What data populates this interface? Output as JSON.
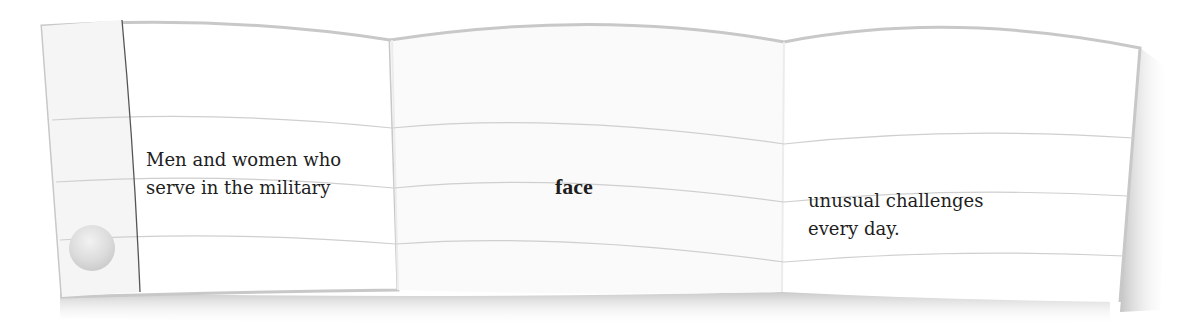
{
  "flipbook": {
    "panels": [
      {
        "id": "left",
        "lines": [
          "Men and women who",
          "serve in the military"
        ],
        "weight": "normal"
      },
      {
        "id": "middle",
        "lines": [
          "face"
        ],
        "weight": "bold"
      },
      {
        "id": "right",
        "lines": [
          "unusual challenges",
          "every day."
        ],
        "weight": "normal"
      }
    ]
  },
  "colors": {
    "paper": "#ffffff",
    "margin_strip": "#f6f6f6",
    "rule_line": "#cfcfcf",
    "edge": "#c4c4c4",
    "margin_line": "#555555",
    "shadow": "#bdbdbd",
    "text": "#1e1e1e"
  }
}
